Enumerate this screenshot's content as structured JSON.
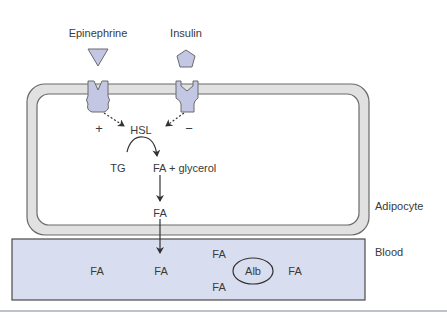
{
  "diagram": {
    "hormones": [
      {
        "label": "Epinephrine",
        "shape": "triangle",
        "effect_sign": "+"
      },
      {
        "label": "Insulin",
        "shape": "pentagon",
        "effect_sign": "−"
      }
    ],
    "enzyme": "HSL",
    "reaction": {
      "substrate": "TG",
      "products": "FA + glycerol"
    },
    "intracellular_product": "FA",
    "compartments": {
      "cell": "Adipocyte",
      "blood": "Blood"
    },
    "blood_contents": {
      "fa_labels": [
        "FA",
        "FA",
        "FA",
        "FA",
        "FA"
      ],
      "carrier": "Alb"
    },
    "colors": {
      "membrane_fill": "#e0e1e0",
      "membrane_stroke": "#6a6a6a",
      "receptor_fill": "#c3c7e3",
      "blood_fill": "#d9ddf0",
      "text": "#3a3a3a"
    }
  }
}
